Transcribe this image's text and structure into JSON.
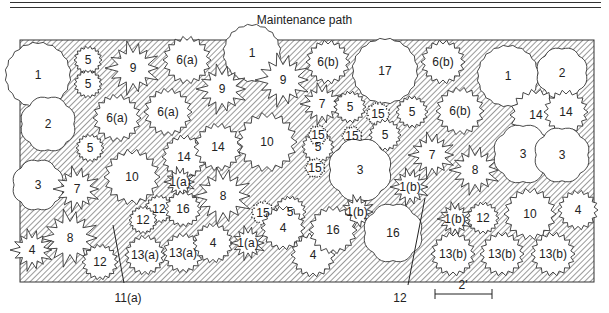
{
  "header": {
    "path_label": "Maintenance path"
  },
  "scale": {
    "label": "2'"
  },
  "callouts": [
    {
      "label": "11(a)",
      "x": 118,
      "y": 298
    },
    {
      "label": "12",
      "x": 400,
      "y": 298
    }
  ],
  "plants": [
    {
      "id": "1",
      "x": 38,
      "y": 75,
      "r": 32,
      "shape": "round"
    },
    {
      "id": "5",
      "x": 88,
      "y": 60,
      "r": 14,
      "shape": "spiky"
    },
    {
      "id": "5",
      "x": 88,
      "y": 84,
      "r": 14,
      "shape": "spiky"
    },
    {
      "id": "9",
      "x": 133,
      "y": 68,
      "r": 28,
      "shape": "star"
    },
    {
      "id": "6(a)",
      "x": 187,
      "y": 60,
      "r": 24,
      "shape": "spiky"
    },
    {
      "id": "1",
      "x": 252,
      "y": 53,
      "r": 28,
      "shape": "round"
    },
    {
      "id": "9",
      "x": 283,
      "y": 80,
      "r": 28,
      "shape": "star"
    },
    {
      "id": "6(b)",
      "x": 328,
      "y": 62,
      "r": 22,
      "shape": "spiky"
    },
    {
      "id": "17",
      "x": 385,
      "y": 71,
      "r": 32,
      "shape": "round"
    },
    {
      "id": "6(b)",
      "x": 443,
      "y": 62,
      "r": 22,
      "shape": "spiky"
    },
    {
      "id": "1",
      "x": 508,
      "y": 76,
      "r": 30,
      "shape": "round"
    },
    {
      "id": "2",
      "x": 562,
      "y": 73,
      "r": 26,
      "shape": "lumpy"
    },
    {
      "id": "2",
      "x": 48,
      "y": 124,
      "r": 28,
      "shape": "lumpy"
    },
    {
      "id": "6(a)",
      "x": 117,
      "y": 118,
      "r": 24,
      "shape": "spiky"
    },
    {
      "id": "6(a)",
      "x": 168,
      "y": 112,
      "r": 24,
      "shape": "spiky"
    },
    {
      "id": "9",
      "x": 222,
      "y": 89,
      "r": 26,
      "shape": "star"
    },
    {
      "id": "7",
      "x": 322,
      "y": 104,
      "r": 22,
      "shape": "star"
    },
    {
      "id": "5",
      "x": 350,
      "y": 107,
      "r": 16,
      "shape": "spiky"
    },
    {
      "id": "15",
      "x": 378,
      "y": 114,
      "r": 12,
      "shape": "dotted"
    },
    {
      "id": "5",
      "x": 385,
      "y": 135,
      "r": 16,
      "shape": "spiky"
    },
    {
      "id": "5",
      "x": 412,
      "y": 112,
      "r": 16,
      "shape": "spiky"
    },
    {
      "id": "6(b)",
      "x": 460,
      "y": 111,
      "r": 24,
      "shape": "spiky"
    },
    {
      "id": "14",
      "x": 536,
      "y": 115,
      "r": 26,
      "shape": "spiky"
    },
    {
      "id": "14",
      "x": 566,
      "y": 112,
      "r": 22,
      "shape": "spiky"
    },
    {
      "id": "5",
      "x": 90,
      "y": 148,
      "r": 14,
      "shape": "spiky"
    },
    {
      "id": "14",
      "x": 184,
      "y": 157,
      "r": 22,
      "shape": "spiky"
    },
    {
      "id": "14",
      "x": 218,
      "y": 147,
      "r": 24,
      "shape": "spiky"
    },
    {
      "id": "10",
      "x": 267,
      "y": 142,
      "r": 30,
      "shape": "spiky"
    },
    {
      "id": "5",
      "x": 318,
      "y": 147,
      "r": 16,
      "shape": "spiky"
    },
    {
      "id": "15",
      "x": 318,
      "y": 135,
      "r": 10,
      "shape": "dotted"
    },
    {
      "id": "15",
      "x": 352,
      "y": 136,
      "r": 10,
      "shape": "dotted"
    },
    {
      "id": "15",
      "x": 315,
      "y": 168,
      "r": 10,
      "shape": "dotted"
    },
    {
      "id": "3",
      "x": 360,
      "y": 170,
      "r": 32,
      "shape": "lumpy"
    },
    {
      "id": "7",
      "x": 432,
      "y": 155,
      "r": 24,
      "shape": "star"
    },
    {
      "id": "8",
      "x": 475,
      "y": 170,
      "r": 26,
      "shape": "star"
    },
    {
      "id": "3",
      "x": 523,
      "y": 154,
      "r": 30,
      "shape": "lumpy"
    },
    {
      "id": "3",
      "x": 562,
      "y": 155,
      "r": 28,
      "shape": "lumpy"
    },
    {
      "id": "3",
      "x": 38,
      "y": 185,
      "r": 26,
      "shape": "lumpy"
    },
    {
      "id": "7",
      "x": 77,
      "y": 189,
      "r": 24,
      "shape": "star"
    },
    {
      "id": "10",
      "x": 132,
      "y": 177,
      "r": 28,
      "shape": "spiky"
    },
    {
      "id": "1(a)",
      "x": 180,
      "y": 182,
      "r": 16,
      "shape": "star"
    },
    {
      "id": "8",
      "x": 223,
      "y": 196,
      "r": 30,
      "shape": "star"
    },
    {
      "id": "15",
      "x": 263,
      "y": 213,
      "r": 12,
      "shape": "dotted"
    },
    {
      "id": "5",
      "x": 290,
      "y": 212,
      "r": 16,
      "shape": "spiky"
    },
    {
      "id": "1(b)",
      "x": 410,
      "y": 187,
      "r": 20,
      "shape": "star"
    },
    {
      "id": "12",
      "x": 159,
      "y": 209,
      "r": 14,
      "shape": "spiky"
    },
    {
      "id": "16",
      "x": 183,
      "y": 209,
      "r": 18,
      "shape": "spiky"
    },
    {
      "id": "12",
      "x": 143,
      "y": 220,
      "r": 14,
      "shape": "spiky"
    },
    {
      "id": "1(b)",
      "x": 357,
      "y": 212,
      "r": 18,
      "shape": "star"
    },
    {
      "id": "1(b)",
      "x": 455,
      "y": 219,
      "r": 18,
      "shape": "star"
    },
    {
      "id": "12",
      "x": 483,
      "y": 218,
      "r": 16,
      "shape": "spiky"
    },
    {
      "id": "10",
      "x": 530,
      "y": 214,
      "r": 26,
      "shape": "spiky"
    },
    {
      "id": "4",
      "x": 578,
      "y": 210,
      "r": 20,
      "shape": "spiky"
    },
    {
      "id": "8",
      "x": 70,
      "y": 238,
      "r": 30,
      "shape": "star"
    },
    {
      "id": "4",
      "x": 32,
      "y": 250,
      "r": 22,
      "shape": "star"
    },
    {
      "id": "12",
      "x": 100,
      "y": 262,
      "r": 18,
      "shape": "spiky"
    },
    {
      "id": "13(a)",
      "x": 145,
      "y": 255,
      "r": 20,
      "shape": "spiky"
    },
    {
      "id": "13(a)",
      "x": 183,
      "y": 253,
      "r": 20,
      "shape": "spiky"
    },
    {
      "id": "4",
      "x": 213,
      "y": 243,
      "r": 20,
      "shape": "spiky"
    },
    {
      "id": "1(a)",
      "x": 248,
      "y": 243,
      "r": 18,
      "shape": "star"
    },
    {
      "id": "4",
      "x": 283,
      "y": 228,
      "r": 22,
      "shape": "spiky"
    },
    {
      "id": "4",
      "x": 313,
      "y": 255,
      "r": 22,
      "shape": "spiky"
    },
    {
      "id": "16",
      "x": 333,
      "y": 230,
      "r": 24,
      "shape": "spiky"
    },
    {
      "id": "16",
      "x": 393,
      "y": 233,
      "r": 30,
      "shape": "lumpy"
    },
    {
      "id": "13(b)",
      "x": 453,
      "y": 254,
      "r": 22,
      "shape": "spiky"
    },
    {
      "id": "13(b)",
      "x": 502,
      "y": 254,
      "r": 22,
      "shape": "spiky"
    },
    {
      "id": "13(b)",
      "x": 553,
      "y": 254,
      "r": 22,
      "shape": "spiky"
    }
  ]
}
